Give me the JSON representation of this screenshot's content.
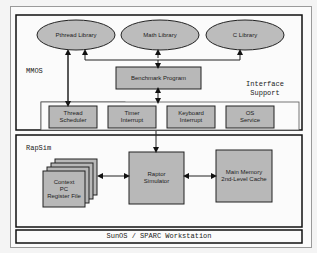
{
  "diagram": {
    "layers": {
      "mmos": {
        "label": "MMOS"
      },
      "interface": {
        "label_line1": "Interface",
        "label_line2": "Support"
      },
      "rapsim": {
        "label": "RapSim"
      },
      "host": {
        "label": "SunOS / SPARC Workstation"
      }
    },
    "libraries": [
      {
        "label": "Pthread Library"
      },
      {
        "label": "Math Library"
      },
      {
        "label": "C Library"
      }
    ],
    "benchmark": {
      "label": "Benchmark Program"
    },
    "interface_boxes": [
      {
        "line1": "Thread",
        "line2": "Scheduler"
      },
      {
        "line1": "Timer",
        "line2": "Interrupt"
      },
      {
        "line1": "Keyboard",
        "line2": "Interrupt"
      },
      {
        "line1": "OS",
        "line2": "Service"
      }
    ],
    "context": {
      "line1": "Context",
      "line2": "PC",
      "line3": "Register File"
    },
    "raptor": {
      "line1": "Raptor",
      "line2": "Simulator"
    },
    "memory": {
      "line1": "Main Memory",
      "line2": "2nd-Level Cache"
    },
    "colors": {
      "box_fill": "#b8b8b8",
      "ellipse_fill": "#bcbcbc",
      "border": "#222222"
    }
  }
}
